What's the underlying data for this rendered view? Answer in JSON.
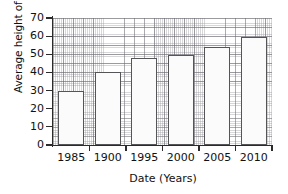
{
  "chart_data": {
    "type": "bar",
    "title": "",
    "xlabel": "Date (Years)",
    "ylabel": "Average height of trees (m)",
    "categories": [
      "1985",
      "1900",
      "1995",
      "2000",
      "2005",
      "2010"
    ],
    "values": [
      30,
      40,
      48,
      49.5,
      54,
      59.5
    ],
    "ylim": [
      0,
      70
    ],
    "yticks": [
      0,
      10,
      20,
      30,
      40,
      50,
      60,
      70
    ],
    "ytick_labels": [
      "0",
      "10",
      "20",
      "30",
      "40",
      "50",
      "60",
      "70"
    ],
    "grid": true,
    "grid_style": "graph-paper",
    "legend": false,
    "legend_position": "none",
    "bar_fill_color": "#fbfbfb",
    "bar_edge_color": "#555558",
    "axis_color": "#2b2b2b",
    "background_color": "#ffffff"
  }
}
